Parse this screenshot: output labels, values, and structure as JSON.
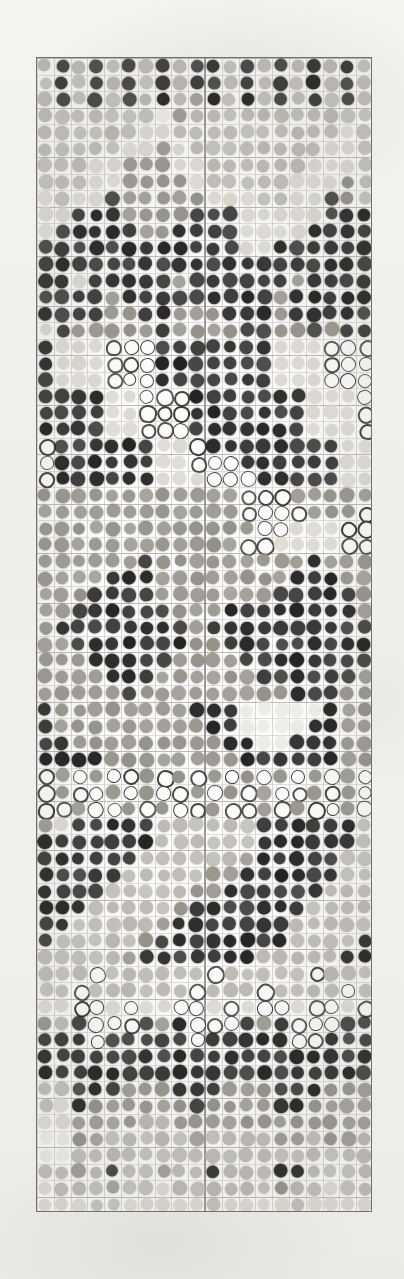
{
  "document": {
    "kind": "macroarray-dot-blot-scan",
    "title": "Macroarray Dot Blot Scan",
    "background_color": "#f2f1ee",
    "panel_border_color": "#6f6f6f",
    "panel_background": "#fbfbfa",
    "grid_line_color": "#c9c9c6",
    "block_divider_color": "#8d8d8d"
  },
  "array": {
    "panel": {
      "x": 36,
      "y": 57,
      "width": 336,
      "height": 1155
    },
    "columns": 20,
    "rows": 70,
    "pitch_x": 16.6,
    "pitch_y": 16.45,
    "spot_diameter": 12.6,
    "blocks": 2,
    "block_split_column": 10,
    "grid_visible": true,
    "grid_major_every_rows": 3,
    "grid_major_every_cols": 1
  },
  "legend": {
    "intensity_scale": [
      "blank",
      "very-faint",
      "faint",
      "light",
      "medium",
      "dark",
      "very-dark"
    ],
    "intensity_colors": [
      "#fdfdfc",
      "#eceae4",
      "#dcd9d1",
      "#bcb9b2",
      "#949189",
      "#5e5b56",
      "#252321"
    ],
    "ring_outline_color": "#3a3834",
    "ring_fill_color": "#fcfcfb"
  },
  "chart_data": {
    "type": "heatmap",
    "xlabel": "",
    "ylabel": "",
    "categories": [],
    "note": "Each cell value is a spot intensity from 0 (blank) to 6 (very dark). Value -1 denotes a ring/donut spot (dark annulus, light centre).",
    "value_range": [
      0,
      6
    ],
    "ring_value": -1,
    "matrix": [
      [
        3,
        6,
        3,
        6,
        3,
        6,
        3,
        6,
        3,
        6,
        6,
        3,
        6,
        3,
        6,
        3,
        6,
        3,
        6,
        3
      ],
      [
        3,
        6,
        3,
        6,
        3,
        6,
        3,
        6,
        3,
        6,
        6,
        3,
        6,
        3,
        6,
        3,
        6,
        3,
        6,
        3
      ],
      [
        3,
        6,
        3,
        6,
        3,
        6,
        3,
        6,
        3,
        4,
        6,
        3,
        6,
        3,
        6,
        3,
        6,
        3,
        6,
        3
      ],
      [
        3,
        3,
        3,
        3,
        3,
        3,
        3,
        1,
        4,
        3,
        3,
        3,
        3,
        3,
        3,
        3,
        3,
        3,
        3,
        3
      ],
      [
        3,
        3,
        3,
        3,
        3,
        3,
        2,
        2,
        3,
        3,
        3,
        3,
        3,
        3,
        3,
        3,
        3,
        3,
        2,
        3
      ],
      [
        3,
        3,
        3,
        3,
        3,
        2,
        2,
        4,
        2,
        3,
        3,
        3,
        3,
        3,
        3,
        3,
        3,
        2,
        2,
        3
      ],
      [
        3,
        3,
        3,
        2,
        2,
        4,
        4,
        4,
        2,
        2,
        3,
        3,
        3,
        3,
        3,
        3,
        2,
        2,
        2,
        3
      ],
      [
        3,
        3,
        3,
        2,
        2,
        4,
        4,
        4,
        4,
        2,
        3,
        3,
        3,
        3,
        3,
        2,
        2,
        2,
        4,
        3
      ],
      [
        2,
        3,
        2,
        2,
        6,
        4,
        4,
        4,
        4,
        4,
        2,
        2,
        2,
        3,
        3,
        2,
        2,
        6,
        4,
        3
      ],
      [
        2,
        2,
        6,
        6,
        6,
        4,
        4,
        4,
        4,
        6,
        6,
        6,
        2,
        2,
        2,
        2,
        2,
        6,
        6,
        6
      ],
      [
        2,
        6,
        6,
        6,
        6,
        6,
        4,
        4,
        6,
        6,
        6,
        6,
        2,
        2,
        2,
        2,
        6,
        6,
        6,
        6
      ],
      [
        6,
        6,
        6,
        6,
        6,
        6,
        6,
        6,
        6,
        6,
        6,
        6,
        2,
        2,
        6,
        6,
        6,
        6,
        6,
        6
      ],
      [
        6,
        6,
        6,
        6,
        6,
        6,
        6,
        6,
        6,
        6,
        6,
        6,
        6,
        6,
        6,
        6,
        6,
        6,
        6,
        6
      ],
      [
        6,
        6,
        2,
        6,
        6,
        6,
        6,
        6,
        4,
        6,
        6,
        6,
        6,
        6,
        6,
        4,
        6,
        6,
        6,
        6
      ],
      [
        6,
        6,
        6,
        6,
        4,
        6,
        6,
        6,
        6,
        6,
        6,
        6,
        6,
        6,
        4,
        6,
        6,
        6,
        6,
        6
      ],
      [
        6,
        6,
        6,
        6,
        4,
        4,
        6,
        6,
        4,
        4,
        4,
        6,
        6,
        6,
        4,
        6,
        6,
        6,
        6,
        6
      ],
      [
        2,
        6,
        4,
        4,
        4,
        4,
        4,
        6,
        4,
        4,
        4,
        4,
        6,
        6,
        4,
        4,
        6,
        4,
        6,
        6
      ],
      [
        6,
        2,
        2,
        2,
        -1,
        -1,
        -1,
        6,
        6,
        6,
        6,
        6,
        6,
        6,
        2,
        2,
        2,
        -1,
        -1,
        -1
      ],
      [
        6,
        2,
        2,
        2,
        -1,
        -1,
        -1,
        6,
        6,
        6,
        6,
        6,
        6,
        6,
        2,
        2,
        2,
        -1,
        -1,
        -1
      ],
      [
        6,
        2,
        2,
        2,
        -1,
        -1,
        -1,
        6,
        6,
        6,
        6,
        6,
        6,
        6,
        2,
        2,
        2,
        -1,
        -1,
        -1
      ],
      [
        6,
        6,
        6,
        6,
        2,
        2,
        -1,
        -1,
        -1,
        6,
        6,
        6,
        6,
        6,
        6,
        6,
        2,
        2,
        2,
        -1
      ],
      [
        6,
        6,
        6,
        6,
        2,
        2,
        -1,
        -1,
        -1,
        6,
        6,
        6,
        6,
        6,
        6,
        6,
        2,
        2,
        2,
        -1
      ],
      [
        6,
        6,
        6,
        6,
        2,
        2,
        -1,
        -1,
        -1,
        6,
        6,
        6,
        6,
        6,
        6,
        6,
        2,
        2,
        2,
        -1
      ],
      [
        -1,
        6,
        6,
        6,
        6,
        6,
        6,
        2,
        2,
        -1,
        6,
        6,
        6,
        6,
        6,
        6,
        6,
        6,
        2,
        2
      ],
      [
        -1,
        6,
        6,
        6,
        6,
        6,
        6,
        2,
        2,
        -1,
        -1,
        -1,
        6,
        6,
        6,
        6,
        6,
        6,
        2,
        2
      ],
      [
        -1,
        6,
        6,
        6,
        6,
        6,
        6,
        2,
        2,
        2,
        -1,
        -1,
        -1,
        6,
        6,
        6,
        6,
        6,
        2,
        2
      ],
      [
        4,
        4,
        4,
        4,
        4,
        4,
        4,
        4,
        4,
        4,
        4,
        4,
        -1,
        -1,
        -1,
        4,
        4,
        4,
        4,
        4
      ],
      [
        4,
        4,
        4,
        4,
        4,
        4,
        4,
        4,
        4,
        4,
        4,
        4,
        -1,
        -1,
        -1,
        -1,
        4,
        4,
        4,
        -1
      ],
      [
        4,
        4,
        4,
        4,
        4,
        4,
        4,
        4,
        4,
        4,
        4,
        4,
        4,
        -1,
        -1,
        2,
        2,
        2,
        -1,
        -1
      ],
      [
        4,
        4,
        4,
        4,
        4,
        4,
        4,
        4,
        4,
        4,
        4,
        4,
        -1,
        -1,
        2,
        2,
        2,
        2,
        -1,
        -1
      ],
      [
        4,
        4,
        4,
        4,
        4,
        4,
        6,
        4,
        4,
        4,
        4,
        4,
        4,
        4,
        4,
        4,
        6,
        4,
        4,
        4
      ],
      [
        4,
        4,
        4,
        4,
        6,
        6,
        6,
        4,
        4,
        4,
        4,
        4,
        4,
        4,
        4,
        6,
        6,
        6,
        4,
        4
      ],
      [
        4,
        4,
        4,
        6,
        6,
        6,
        6,
        4,
        4,
        4,
        4,
        4,
        4,
        4,
        6,
        6,
        6,
        6,
        6,
        4
      ],
      [
        4,
        4,
        6,
        6,
        6,
        6,
        6,
        6,
        4,
        4,
        4,
        6,
        6,
        6,
        6,
        6,
        6,
        6,
        6,
        4
      ],
      [
        4,
        6,
        6,
        6,
        6,
        6,
        6,
        6,
        6,
        4,
        6,
        6,
        6,
        6,
        6,
        6,
        6,
        6,
        6,
        6
      ],
      [
        4,
        4,
        6,
        6,
        6,
        6,
        6,
        6,
        6,
        4,
        4,
        6,
        6,
        6,
        6,
        6,
        6,
        6,
        6,
        6
      ],
      [
        4,
        4,
        4,
        6,
        6,
        6,
        6,
        6,
        4,
        4,
        4,
        4,
        6,
        6,
        6,
        6,
        6,
        6,
        6,
        6
      ],
      [
        4,
        4,
        4,
        4,
        6,
        6,
        6,
        4,
        4,
        4,
        4,
        4,
        4,
        6,
        6,
        6,
        6,
        6,
        6,
        4
      ],
      [
        4,
        4,
        4,
        4,
        4,
        6,
        4,
        4,
        4,
        4,
        4,
        4,
        4,
        4,
        4,
        6,
        6,
        6,
        4,
        4
      ],
      [
        6,
        4,
        4,
        4,
        4,
        4,
        4,
        4,
        4,
        6,
        6,
        6,
        1,
        1,
        1,
        1,
        1,
        6,
        4,
        4
      ],
      [
        6,
        4,
        4,
        4,
        4,
        4,
        4,
        4,
        4,
        4,
        6,
        6,
        1,
        1,
        1,
        1,
        6,
        6,
        4,
        4
      ],
      [
        6,
        6,
        4,
        4,
        4,
        4,
        4,
        4,
        4,
        4,
        4,
        6,
        6,
        1,
        1,
        6,
        6,
        6,
        4,
        4
      ],
      [
        6,
        6,
        6,
        6,
        4,
        4,
        4,
        4,
        4,
        4,
        4,
        4,
        6,
        6,
        6,
        6,
        6,
        6,
        4,
        4
      ],
      [
        -1,
        4,
        -1,
        4,
        -1,
        -1,
        4,
        -1,
        4,
        -1,
        4,
        -1,
        4,
        -1,
        4,
        -1,
        4,
        -1,
        4,
        -1
      ],
      [
        -1,
        4,
        -1,
        -1,
        4,
        -1,
        4,
        -1,
        -1,
        4,
        -1,
        4,
        -1,
        4,
        -1,
        -1,
        4,
        -1,
        4,
        -1
      ],
      [
        -1,
        -1,
        4,
        -1,
        -1,
        4,
        -1,
        4,
        -1,
        -1,
        4,
        -1,
        -1,
        4,
        -1,
        4,
        -1,
        -1,
        4,
        -1
      ],
      [
        4,
        2,
        6,
        6,
        6,
        6,
        6,
        3,
        3,
        3,
        3,
        3,
        3,
        6,
        6,
        6,
        6,
        6,
        6,
        3
      ],
      [
        6,
        6,
        6,
        6,
        6,
        6,
        6,
        3,
        3,
        3,
        3,
        3,
        3,
        6,
        6,
        6,
        6,
        6,
        6,
        3
      ],
      [
        6,
        6,
        6,
        6,
        6,
        6,
        3,
        3,
        3,
        3,
        3,
        3,
        4,
        6,
        6,
        6,
        6,
        6,
        3,
        3
      ],
      [
        6,
        6,
        6,
        6,
        6,
        3,
        3,
        3,
        3,
        3,
        4,
        4,
        6,
        6,
        6,
        6,
        6,
        6,
        3,
        3
      ],
      [
        6,
        6,
        6,
        6,
        3,
        3,
        3,
        3,
        3,
        4,
        4,
        6,
        6,
        6,
        6,
        6,
        6,
        3,
        3,
        3
      ],
      [
        6,
        6,
        6,
        3,
        3,
        3,
        3,
        3,
        4,
        6,
        6,
        6,
        6,
        6,
        6,
        6,
        3,
        3,
        3,
        3
      ],
      [
        6,
        6,
        3,
        3,
        3,
        3,
        3,
        4,
        6,
        6,
        6,
        6,
        6,
        6,
        6,
        3,
        3,
        3,
        3,
        3
      ],
      [
        6,
        3,
        3,
        3,
        3,
        3,
        4,
        6,
        6,
        6,
        6,
        6,
        6,
        6,
        6,
        3,
        3,
        3,
        3,
        6
      ],
      [
        3,
        3,
        3,
        3,
        3,
        4,
        6,
        6,
        6,
        6,
        6,
        6,
        6,
        3,
        3,
        3,
        3,
        3,
        6,
        6
      ],
      [
        3,
        3,
        3,
        -1,
        3,
        3,
        3,
        3,
        3,
        3,
        -1,
        3,
        3,
        3,
        3,
        3,
        -1,
        3,
        3,
        3
      ],
      [
        3,
        3,
        -1,
        3,
        3,
        3,
        3,
        3,
        3,
        -1,
        3,
        3,
        3,
        -1,
        3,
        3,
        3,
        3,
        -1,
        3
      ],
      [
        2,
        2,
        -1,
        -1,
        2,
        -1,
        2,
        2,
        -1,
        -1,
        2,
        -1,
        2,
        -1,
        -1,
        2,
        -1,
        -1,
        2,
        -1
      ],
      [
        4,
        3,
        6,
        -1,
        -1,
        -1,
        6,
        4,
        6,
        -1,
        -1,
        -1,
        6,
        4,
        6,
        -1,
        -1,
        -1,
        6,
        6
      ],
      [
        6,
        6,
        6,
        -1,
        6,
        6,
        6,
        6,
        6,
        -1,
        6,
        6,
        6,
        6,
        6,
        -1,
        -1,
        6,
        6,
        6
      ],
      [
        6,
        6,
        6,
        6,
        6,
        6,
        6,
        6,
        6,
        6,
        6,
        6,
        6,
        6,
        6,
        6,
        6,
        6,
        6,
        6
      ],
      [
        6,
        6,
        6,
        6,
        6,
        6,
        6,
        6,
        6,
        6,
        6,
        6,
        6,
        6,
        6,
        6,
        6,
        6,
        6,
        6
      ],
      [
        3,
        3,
        6,
        6,
        6,
        4,
        4,
        4,
        6,
        6,
        6,
        4,
        4,
        4,
        6,
        6,
        6,
        4,
        4,
        4
      ],
      [
        3,
        2,
        6,
        4,
        4,
        4,
        4,
        4,
        4,
        6,
        4,
        4,
        4,
        4,
        6,
        6,
        4,
        4,
        4,
        4
      ],
      [
        2,
        2,
        4,
        4,
        4,
        4,
        3,
        3,
        4,
        4,
        4,
        4,
        4,
        4,
        4,
        4,
        4,
        4,
        4,
        4
      ],
      [
        1,
        1,
        4,
        4,
        3,
        3,
        3,
        3,
        3,
        4,
        3,
        3,
        3,
        3,
        4,
        4,
        3,
        4,
        4,
        3
      ],
      [
        1,
        1,
        3,
        3,
        3,
        3,
        3,
        3,
        3,
        3,
        3,
        3,
        3,
        3,
        3,
        3,
        3,
        3,
        3,
        3
      ],
      [
        3,
        3,
        4,
        3,
        6,
        3,
        3,
        4,
        3,
        3,
        6,
        3,
        3,
        3,
        6,
        6,
        3,
        3,
        3,
        3
      ],
      [
        2,
        3,
        3,
        3,
        4,
        3,
        3,
        2,
        3,
        3,
        3,
        3,
        3,
        3,
        4,
        3,
        3,
        2,
        3,
        3
      ],
      [
        2,
        2,
        2,
        3,
        3,
        2,
        2,
        2,
        2,
        2,
        3,
        2,
        2,
        2,
        2,
        3,
        2,
        2,
        2,
        2
      ]
    ]
  }
}
